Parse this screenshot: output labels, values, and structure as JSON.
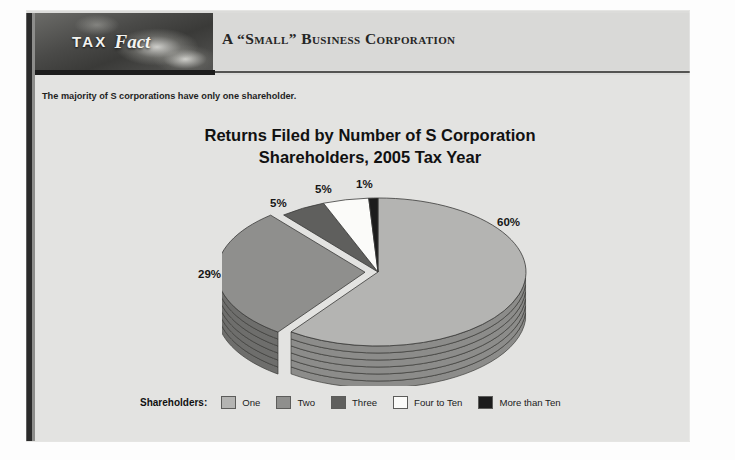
{
  "document": {
    "logo": {
      "tax_word": "TAX",
      "fact_word": "Fact"
    },
    "header_title": "A “Small” Business Corporation",
    "subtitle": "The majority of S corporations have only one shareholder."
  },
  "chart_data": {
    "type": "pie",
    "title": "Returns Filed by Number of S Corporation Shareholders, 2005 Tax Year",
    "title_line1": "Returns Filed by Number of S Corporation",
    "title_line2": "Shareholders, 2005 Tax Year",
    "legend_title": "Shareholders:",
    "legend_position": "bottom",
    "categories": [
      "One",
      "Two",
      "Three",
      "Four to Ten",
      "More than Ten"
    ],
    "values": [
      60,
      29,
      5,
      5,
      1
    ],
    "labels": [
      "60%",
      "29%",
      "5%",
      "5%",
      "1%"
    ],
    "colors": [
      "#b4b4b2",
      "#8f8f8d",
      "#5f5f5d",
      "#fbfbf9",
      "#1c1c1c"
    ],
    "side_colors": [
      "#8c8c8a",
      "#6e6e6c",
      "#4a4a48",
      "#c8c8c4",
      "#121212"
    ],
    "xlabel": "",
    "ylabel": "",
    "grid": false,
    "three_d": true,
    "exploded_slice": "Two"
  },
  "legend": [
    {
      "label": "One",
      "color": "#b4b4b2"
    },
    {
      "label": "Two",
      "color": "#8f8f8d"
    },
    {
      "label": "Three",
      "color": "#5f5f5d"
    },
    {
      "label": "Four to Ten",
      "color": "#fbfbf9"
    },
    {
      "label": "More than Ten",
      "color": "#1c1c1c"
    }
  ]
}
